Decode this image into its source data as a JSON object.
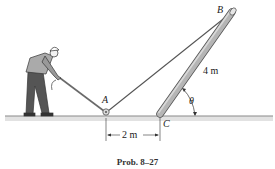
{
  "figure": {
    "caption": "Prob. 8–27",
    "labels": {
      "point_a": "A",
      "point_b": "B",
      "point_c": "C",
      "angle": "θ",
      "pole_length": "4 m",
      "distance_ac": "2 m"
    },
    "elements": {
      "worker": "person-pulling-rope",
      "pulley": "pulley-at-A",
      "pole": "pole-BC",
      "rope": "rope-from-worker-over-A-to-B",
      "ground": "ground-line"
    },
    "colors": {
      "ground": "#8a8a8a",
      "pole": "#a9a9a9",
      "rope": "#555555",
      "text": "#1a1a1a"
    }
  }
}
